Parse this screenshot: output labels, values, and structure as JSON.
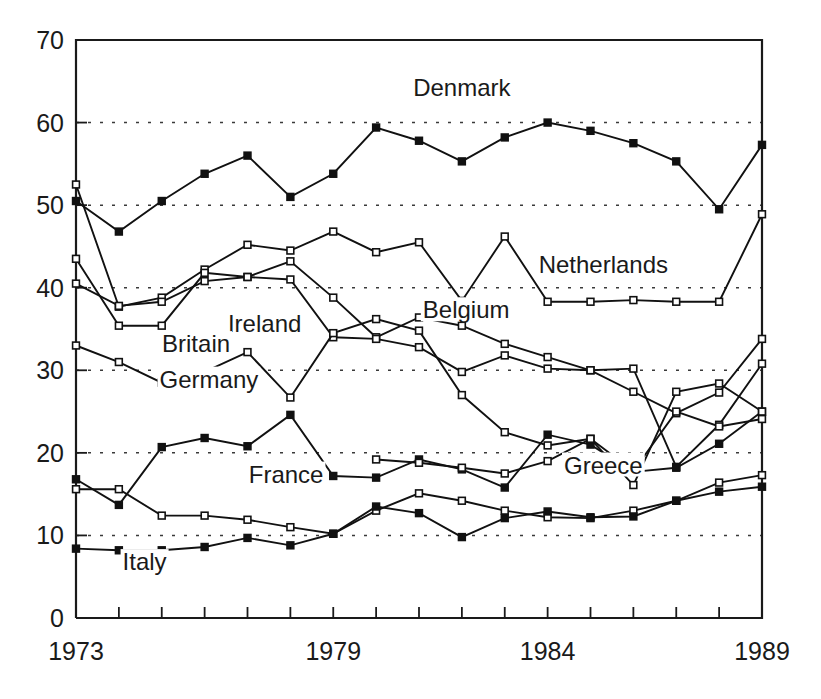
{
  "chart_data": {
    "type": "line",
    "title": "",
    "subtitle": "",
    "xlabel": "",
    "ylabel": "",
    "xlim": [
      1973,
      1989
    ],
    "ylim": [
      0,
      70
    ],
    "grid": true,
    "grid_axis": "y",
    "legend_position": "inline-annotations",
    "x": [
      1973,
      1974,
      1975,
      1976,
      1977,
      1978,
      1979,
      1980,
      1981,
      1982,
      1983,
      1984,
      1985,
      1986,
      1987,
      1988,
      1989
    ],
    "y_ticks": [
      0,
      10,
      20,
      30,
      40,
      50,
      60,
      70
    ],
    "y_tick_labels": [
      "0",
      "10",
      "20",
      "30",
      "40",
      "50",
      "60",
      "70"
    ],
    "x_tick_labels_shown": [
      "1973",
      "1979",
      "1984",
      "1989"
    ],
    "x_tick_label_positions": [
      1973,
      1979,
      1984,
      1989
    ],
    "series": [
      {
        "name": "Denmark",
        "marker": "filled-square",
        "values": [
          50.5,
          46.8,
          50.5,
          53.8,
          56.0,
          51.0,
          53.8,
          59.4,
          57.8,
          55.3,
          58.2,
          60.0,
          59.0,
          57.5,
          55.3,
          49.5,
          57.3
        ],
        "label": "Denmark",
        "label_x": 1982.0,
        "label_y": 63.2
      },
      {
        "name": "Netherlands",
        "marker": "open-square",
        "values": [
          52.5,
          37.7,
          38.8,
          42.2,
          45.2,
          44.5,
          46.8,
          44.3,
          45.5,
          38.4,
          46.2,
          38.3,
          38.3,
          38.5,
          38.3,
          38.3,
          48.9
        ],
        "label": "Netherlands",
        "label_x": 1985.3,
        "label_y": 41.8
      },
      {
        "name": "Belgium",
        "marker": "open-square",
        "values": [
          43.5,
          35.4,
          35.4,
          41.8,
          41.3,
          43.2,
          38.8,
          34.0,
          36.4,
          35.4,
          33.2,
          31.6,
          30.0,
          27.4,
          24.8,
          27.3,
          33.8
        ],
        "label": "Belgium",
        "label_x": 1982.1,
        "label_y": 36.3
      },
      {
        "name": "Ireland",
        "marker": "open-square",
        "values": [
          40.5,
          37.8,
          38.3,
          40.8,
          41.3,
          41.0,
          34.0,
          33.8,
          32.8,
          29.8,
          31.8,
          30.2,
          30.0,
          30.2,
          18.3,
          23.4,
          30.8
        ],
        "label": "Ireland",
        "label_x": 1977.4,
        "label_y": 34.6
      },
      {
        "name": "Britain",
        "marker": "open-square",
        "values": [
          33.0,
          31.0,
          28.5,
          29.8,
          32.2,
          26.7,
          34.5,
          36.2,
          34.8,
          27.0,
          22.5,
          20.9,
          21.7,
          17.8,
          25.0,
          23.2,
          24.1
        ],
        "label": "Britain",
        "label_x": 1975.8,
        "label_y": 32.2
      },
      {
        "name": "Germany",
        "marker": "filled-square",
        "values": [
          16.8,
          13.7,
          20.7,
          21.8,
          20.8,
          24.6,
          17.2,
          17.0,
          19.2,
          18.0,
          15.8,
          22.2,
          21.0,
          17.7,
          18.2,
          21.1,
          25.0
        ],
        "label": "Germany",
        "label_x": 1976.1,
        "label_y": 27.9
      },
      {
        "name": "France",
        "marker": "open-square",
        "values": [
          15.6,
          15.6,
          12.4,
          12.4,
          11.9,
          11.0,
          10.2,
          13.0,
          15.1,
          14.2,
          13.0,
          12.2,
          12.1,
          13.0,
          14.2,
          16.4,
          17.3
        ],
        "label": "France",
        "label_x": 1977.9,
        "label_y": 16.4
      },
      {
        "name": "Italy",
        "marker": "filled-square",
        "values": [
          8.4,
          8.2,
          8.2,
          8.6,
          9.7,
          8.8,
          10.2,
          13.5,
          12.7,
          9.8,
          12.1,
          12.9,
          12.2,
          12.3,
          14.2,
          15.3,
          15.9
        ],
        "label": "Italy",
        "label_x": 1974.6,
        "label_y": 5.8
      },
      {
        "name": "Greece",
        "marker": "open-square",
        "values": [
          null,
          null,
          null,
          null,
          null,
          null,
          null,
          19.2,
          18.8,
          18.2,
          17.5,
          19.0,
          21.7,
          16.1,
          27.4,
          28.4,
          25.0
        ],
        "label": "Greece",
        "label_x": 1985.3,
        "label_y": 17.5
      }
    ],
    "annotations": [
      {
        "text": "Denmark"
      },
      {
        "text": "Netherlands"
      },
      {
        "text": "Belgium"
      },
      {
        "text": "Ireland"
      },
      {
        "text": "Britain"
      },
      {
        "text": "Germany"
      },
      {
        "text": "France"
      },
      {
        "text": "Italy"
      },
      {
        "text": "Greece"
      }
    ],
    "colors": {
      "line": "#111111",
      "marker_fill_open": "#ffffff",
      "marker_fill_solid": "#111111",
      "axis": "#1a1a1a",
      "grid": "#3a3a3a",
      "background": "#ffffff"
    }
  },
  "axes": {
    "y_labels": [
      "70",
      "60",
      "50",
      "40",
      "30",
      "20",
      "10",
      "0"
    ],
    "x_labels": [
      "1973",
      "1979",
      "1984",
      "1989"
    ]
  }
}
